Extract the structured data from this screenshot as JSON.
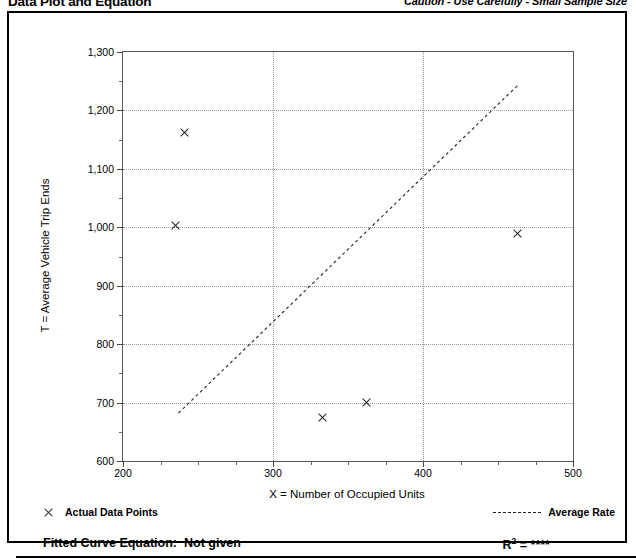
{
  "header": {
    "title": "Data Plot and Equation",
    "caution": "Caution - Use Carefully - Small Sample Size"
  },
  "legend": {
    "data_points_label": "Actual Data Points",
    "average_rate_label": "Average Rate",
    "marker_icon": "x-cross-icon",
    "line_icon": "dashed-line-icon"
  },
  "footer": {
    "equation_label": "Fitted Curve Equation:",
    "equation_value": "Not given",
    "r2_label": "R",
    "r2_exponent": "2",
    "r2_equals": "=",
    "r2_value": "****"
  },
  "chart_data": {
    "type": "scatter",
    "title": "Data Plot and Equation",
    "subtitle": "Caution - Use Carefully - Small Sample Size",
    "xlabel": "X = Number of Occupied Units",
    "ylabel": "T = Average Vehicle Trip Ends",
    "xlim": [
      200,
      500
    ],
    "ylim": [
      600,
      1300
    ],
    "x_ticks": [
      200,
      300,
      400,
      500
    ],
    "x_tick_labels": [
      "200",
      "300",
      "400",
      "500"
    ],
    "x_minor_step": 25,
    "y_ticks": [
      600,
      700,
      800,
      900,
      1000,
      1100,
      1200,
      1300
    ],
    "y_tick_labels": [
      "600",
      "700",
      "800",
      "900",
      "1,000",
      "1,100",
      "1,200",
      "1,300"
    ],
    "y_minor_step": 50,
    "grid": true,
    "grid_style": "dotted",
    "legend_position": "below-plot",
    "series": [
      {
        "name": "Actual Data Points",
        "type": "scatter",
        "marker": "x",
        "points": [
          {
            "x": 235,
            "y": 1003
          },
          {
            "x": 241,
            "y": 1162
          },
          {
            "x": 333,
            "y": 675
          },
          {
            "x": 362,
            "y": 700
          },
          {
            "x": 463,
            "y": 989
          }
        ]
      },
      {
        "name": "Average Rate",
        "type": "line",
        "style": "dashed",
        "points": [
          {
            "x": 237,
            "y": 682
          },
          {
            "x": 464,
            "y": 1245
          }
        ]
      }
    ],
    "annotations": [
      {
        "text": "Fitted Curve Equation:  Not given"
      },
      {
        "text": "R2 = ****"
      }
    ]
  }
}
